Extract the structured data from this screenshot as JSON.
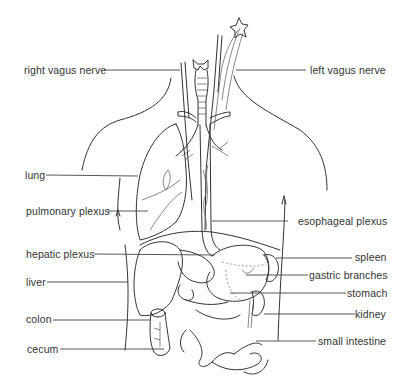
{
  "diagram": {
    "left_labels": [
      {
        "id": "right-vagus-nerve",
        "text": "right vagus nerve",
        "y": 70
      },
      {
        "id": "lung",
        "text": "lung",
        "y": 175
      },
      {
        "id": "pulmonary-plexus",
        "text": "pulmonary plexus",
        "y": 211
      },
      {
        "id": "hepatic-plexus",
        "text": "hepatic plexus",
        "y": 254
      },
      {
        "id": "liver",
        "text": "liver",
        "y": 282
      },
      {
        "id": "colon",
        "text": "colon",
        "y": 319
      },
      {
        "id": "cecum",
        "text": "cecum",
        "y": 349
      }
    ],
    "right_labels": [
      {
        "id": "left-vagus-nerve",
        "text": "left vagus nerve",
        "y": 70
      },
      {
        "id": "esophageal-plexus",
        "text": "esophageal plexus",
        "y": 221
      },
      {
        "id": "spleen",
        "text": "spleen",
        "y": 257
      },
      {
        "id": "gastric-branches",
        "text": "gastric branches",
        "y": 275
      },
      {
        "id": "stomach",
        "text": "stomach",
        "y": 293
      },
      {
        "id": "kidney",
        "text": "kidney",
        "y": 314
      },
      {
        "id": "small-intestine",
        "text": "small intestine",
        "y": 341
      }
    ]
  }
}
